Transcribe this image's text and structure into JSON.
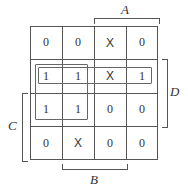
{
  "kmap": {
    "cells": [
      [
        "0",
        "0",
        "X",
        "0"
      ],
      [
        "1",
        "1",
        "X",
        "1"
      ],
      [
        "1",
        "1",
        "0",
        "0"
      ],
      [
        "0",
        "X",
        "0",
        "0"
      ]
    ],
    "labels": {
      "A": "A",
      "B": "B",
      "C": "C",
      "D": "D"
    },
    "groups": [
      {
        "name": "row-2-quad",
        "rows": [
          1
        ],
        "cols": [
          0,
          1,
          2,
          3
        ]
      },
      {
        "name": "square-quad",
        "rows": [
          1,
          2
        ],
        "cols": [
          0,
          1
        ]
      }
    ]
  }
}
